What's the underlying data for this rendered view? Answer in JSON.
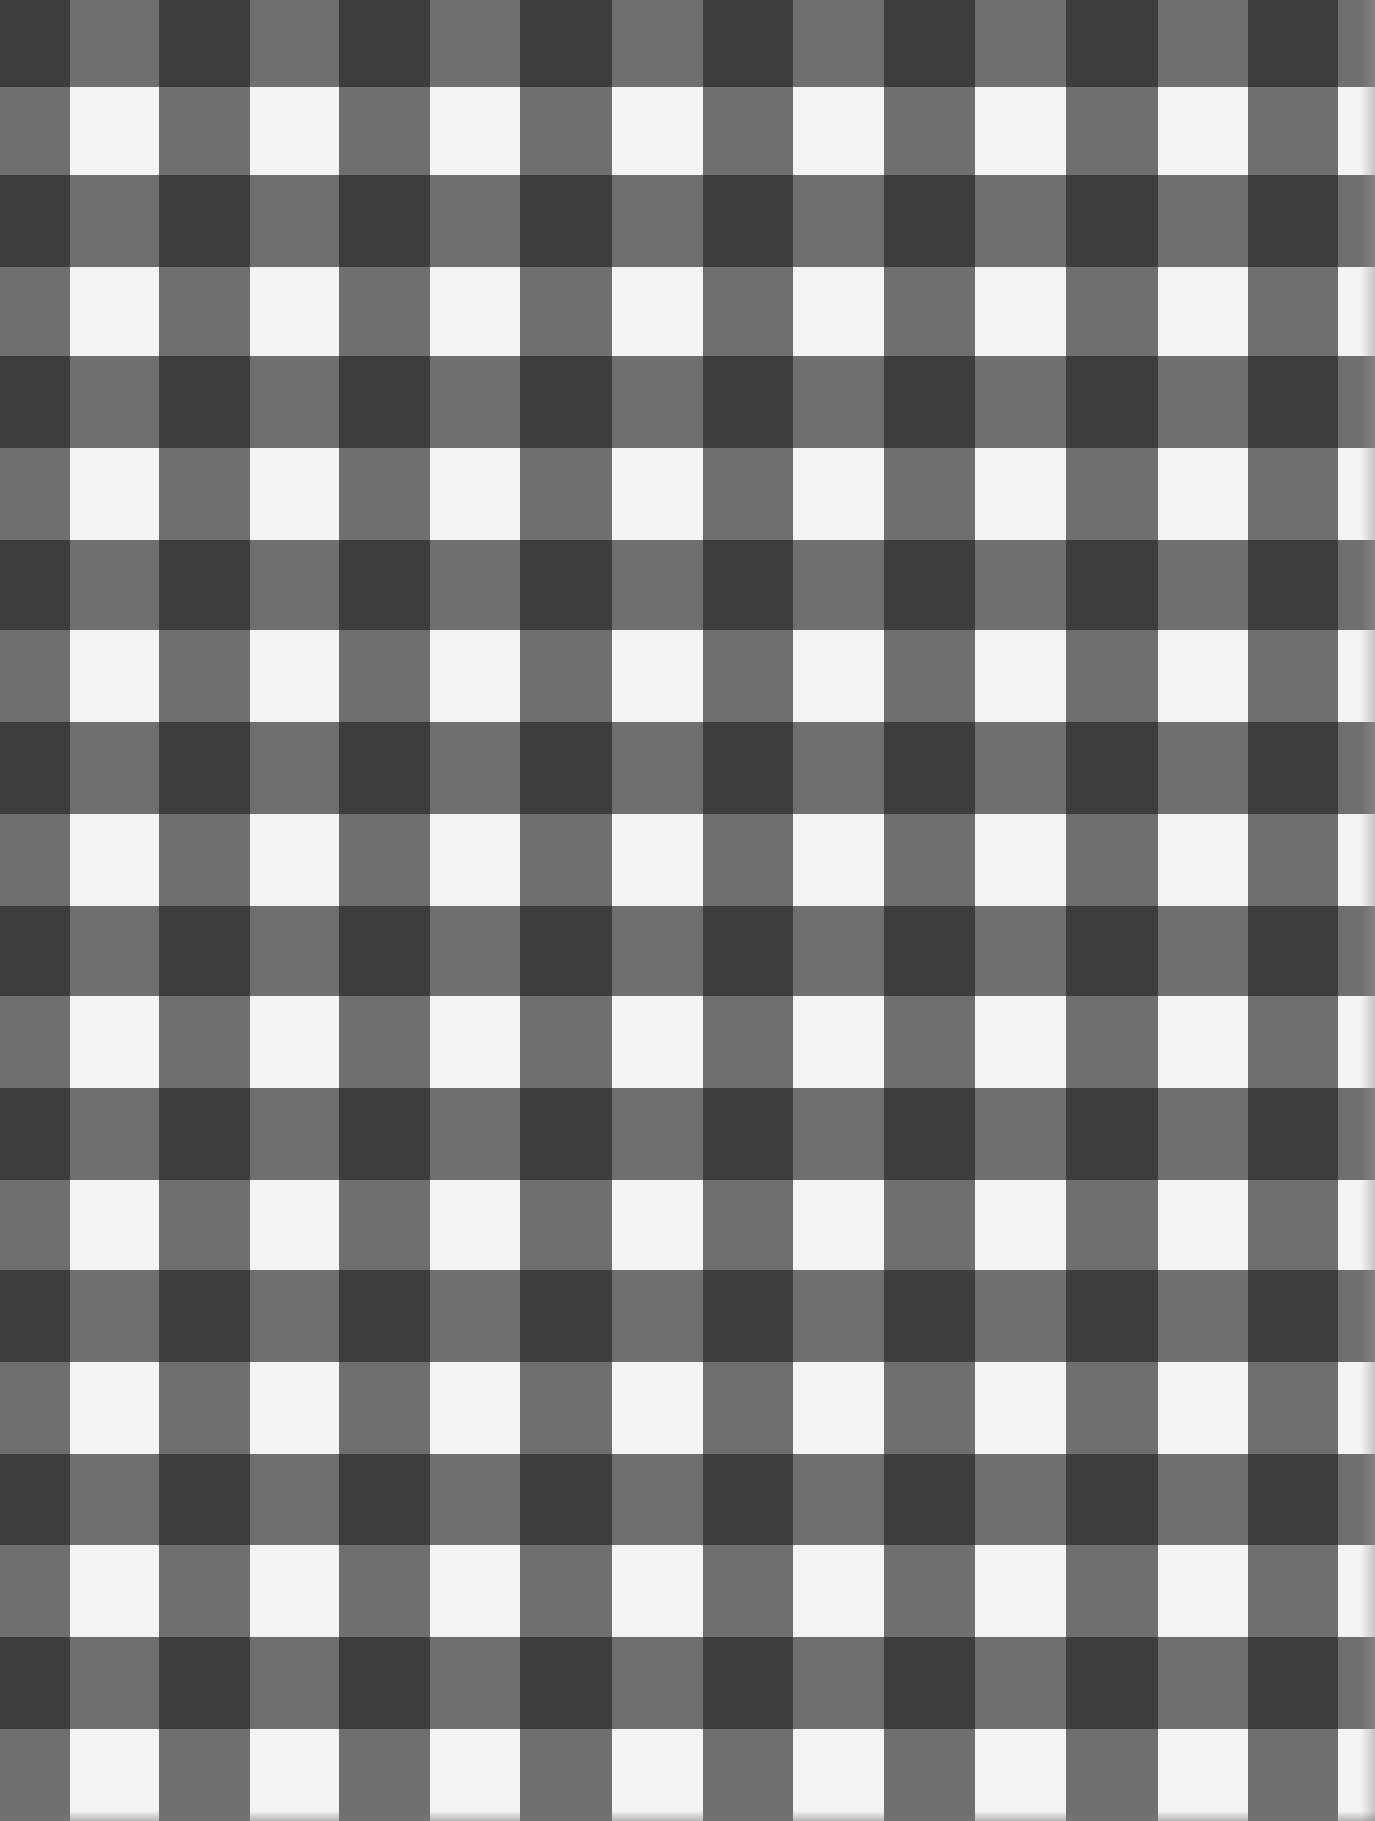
{
  "image": {
    "subject": "black and white gingham check pattern",
    "width": 1375,
    "height": 1821
  },
  "colors": {
    "dark": "#3d3d3d",
    "mid": "#6f6f6f",
    "light": "#f3f3f3"
  },
  "grid": {
    "column_edges": [
      0,
      70,
      159,
      250,
      339,
      430,
      520,
      612,
      703,
      793,
      884,
      975,
      1066,
      1158,
      1248,
      1338,
      1375
    ],
    "row_edges": [
      0,
      87,
      175,
      267,
      356,
      448,
      540,
      630,
      722,
      814,
      906,
      996,
      1088,
      1180,
      1270,
      1362,
      1454,
      1545,
      1637,
      1729,
      1821
    ],
    "first_column_is_dark_band": true,
    "first_row_is_dark_band": true
  }
}
